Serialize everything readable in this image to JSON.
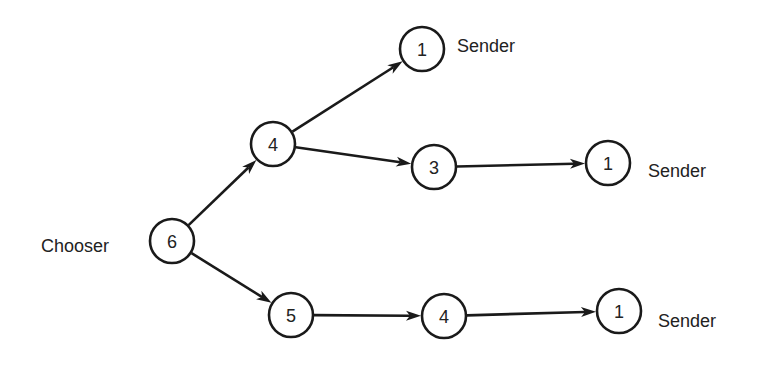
{
  "diagram": {
    "type": "directed-tree",
    "colors": {
      "stroke": "#1a1a1a",
      "text": "#222222",
      "background": "#ffffff"
    },
    "nodes": [
      {
        "id": "n6",
        "value": "6",
        "cx": 172,
        "cy": 241,
        "r": 22
      },
      {
        "id": "n4a",
        "value": "4",
        "cx": 273,
        "cy": 144,
        "r": 22
      },
      {
        "id": "n1a",
        "value": "1",
        "cx": 422,
        "cy": 49,
        "r": 22
      },
      {
        "id": "n3",
        "value": "3",
        "cx": 434,
        "cy": 167,
        "r": 22
      },
      {
        "id": "n1b",
        "value": "1",
        "cx": 608,
        "cy": 163,
        "r": 22
      },
      {
        "id": "n5",
        "value": "5",
        "cx": 291,
        "cy": 315,
        "r": 22
      },
      {
        "id": "n4b",
        "value": "4",
        "cx": 444,
        "cy": 316,
        "r": 22
      },
      {
        "id": "n1c",
        "value": "1",
        "cx": 619,
        "cy": 311,
        "r": 22
      }
    ],
    "edges": [
      {
        "from": "n6",
        "to": "n4a"
      },
      {
        "from": "n6",
        "to": "n5"
      },
      {
        "from": "n4a",
        "to": "n1a"
      },
      {
        "from": "n4a",
        "to": "n3"
      },
      {
        "from": "n3",
        "to": "n1b"
      },
      {
        "from": "n5",
        "to": "n4b"
      },
      {
        "from": "n4b",
        "to": "n1c"
      }
    ],
    "labels": [
      {
        "id": "chooser",
        "text": "Chooser",
        "x": 41,
        "y": 252
      },
      {
        "id": "sender-top",
        "text": "Sender",
        "x": 457,
        "y": 52
      },
      {
        "id": "sender-mid",
        "text": "Sender",
        "x": 648,
        "y": 177
      },
      {
        "id": "sender-bottom",
        "text": "Sender",
        "x": 658,
        "y": 327
      }
    ]
  }
}
